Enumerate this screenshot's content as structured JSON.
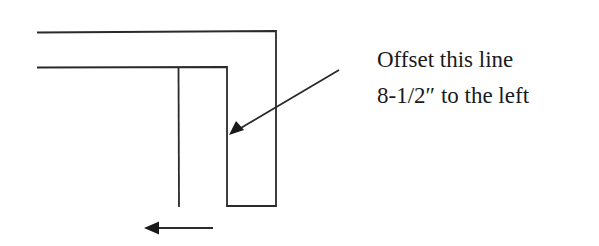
{
  "annotation": {
    "line1": "Offset this line",
    "line2": "8-1/2″ to the left"
  },
  "colors": {
    "stroke": "#2a2a2a",
    "background": "#ffffff",
    "text": "#1a1a1a"
  },
  "geometry": {
    "outer_path": "37,32 276,31 276,206 227,206 227,67 37,67",
    "offset_line": {
      "x": 178,
      "y1": 67,
      "y2": 207
    },
    "pointer_arrow": {
      "from": [
        339,
        70
      ],
      "tip": [
        229,
        135
      ]
    },
    "direction_arrow": {
      "from": [
        213,
        228
      ],
      "tip": [
        144,
        228
      ]
    }
  }
}
